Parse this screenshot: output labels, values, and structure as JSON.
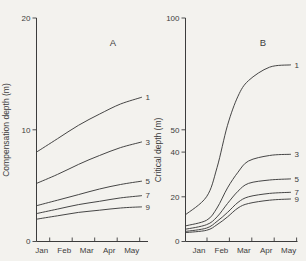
{
  "figure": {
    "colors": {
      "ink": "#3c3c3c",
      "paper": "#f3f2ee"
    }
  },
  "chart_data": [
    {
      "type": "line",
      "panel_label": "A",
      "ylabel": "Compensation depth (m)",
      "xlabel_months": [
        "Jan",
        "Feb",
        "Mar",
        "Apr",
        "May"
      ],
      "ylim": [
        0,
        20
      ],
      "yticks": [
        0,
        10,
        20
      ],
      "grid": false,
      "legend_position": "labels-at-curve-right-ends",
      "x_frac": [
        0,
        0.2,
        0.4,
        0.6,
        0.8,
        1
      ],
      "series": [
        {
          "name": "1",
          "values": [
            8.0,
            9.2,
            10.4,
            11.4,
            12.3,
            12.9
          ]
        },
        {
          "name": "3",
          "values": [
            5.2,
            6.0,
            6.9,
            7.7,
            8.4,
            8.9
          ]
        },
        {
          "name": "5",
          "values": [
            3.2,
            3.7,
            4.2,
            4.7,
            5.1,
            5.4
          ]
        },
        {
          "name": "7",
          "values": [
            2.5,
            2.9,
            3.3,
            3.6,
            3.9,
            4.1
          ]
        },
        {
          "name": "9",
          "values": [
            2.0,
            2.3,
            2.6,
            2.8,
            3.0,
            3.1
          ]
        }
      ]
    },
    {
      "type": "line",
      "panel_label": "B",
      "ylabel": "Critical depth (m)",
      "xlabel_months": [
        "Jan",
        "Feb",
        "Mar",
        "Apr",
        "May"
      ],
      "ylim": [
        0,
        100
      ],
      "yticks": [
        0,
        20,
        40,
        50,
        100
      ],
      "grid": false,
      "legend_position": "labels-at-curve-right-ends",
      "x_frac": [
        0,
        0.2,
        0.3,
        0.4,
        0.5,
        0.6,
        0.8,
        1
      ],
      "series": [
        {
          "name": "1",
          "values": [
            12,
            20,
            33,
            52,
            65,
            72,
            78,
            79
          ]
        },
        {
          "name": "3",
          "values": [
            7,
            9.5,
            15,
            24,
            31,
            36,
            38.5,
            39
          ]
        },
        {
          "name": "5",
          "values": [
            5.5,
            7.5,
            11,
            17,
            22.5,
            26,
            27.5,
            28
          ]
        },
        {
          "name": "7",
          "values": [
            4.5,
            6,
            9,
            13,
            17.5,
            20,
            21.5,
            22
          ]
        },
        {
          "name": "9",
          "values": [
            4,
            5,
            7.5,
            11,
            15,
            17,
            18.5,
            19
          ]
        }
      ]
    }
  ]
}
